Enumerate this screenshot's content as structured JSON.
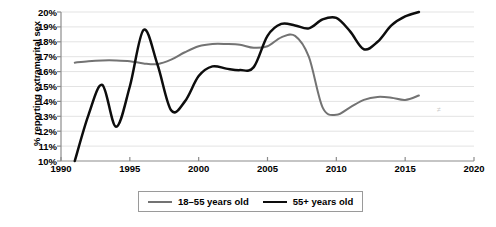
{
  "chart_data": {
    "type": "line",
    "title": "",
    "xlabel": "",
    "ylabel": "% reporting extramarital sex",
    "xlim": [
      1990,
      2020
    ],
    "ylim": [
      10,
      20
    ],
    "grid": true,
    "grid_axis": "y",
    "legend_position": "bottom-center",
    "x_ticks": [
      1990,
      1995,
      2000,
      2005,
      2010,
      2015,
      2020
    ],
    "x_tick_labels": [
      "1990",
      "1995",
      "2000",
      "2005",
      "2010",
      "2015",
      "2020"
    ],
    "y_ticks": [
      10,
      11,
      12,
      13,
      14,
      15,
      16,
      17,
      18,
      19,
      20
    ],
    "y_tick_labels": [
      "10%",
      "11%",
      "12%",
      "13%",
      "14%",
      "15%",
      "16%",
      "17%",
      "18%",
      "19%",
      "20%"
    ],
    "series": [
      {
        "name": "18–55 years old",
        "color": "#737373",
        "width": 2.0,
        "x": [
          1991,
          1992,
          1993,
          1994,
          1995,
          1996,
          1997,
          1998,
          1999,
          2000,
          2001,
          2002,
          2003,
          2004,
          2005,
          2006,
          2007,
          2008,
          2009,
          2010,
          2011,
          2012,
          2013,
          2014,
          2015,
          2016
        ],
        "values": [
          16.6,
          16.7,
          16.75,
          16.75,
          16.7,
          16.55,
          16.5,
          16.8,
          17.3,
          17.7,
          17.85,
          17.85,
          17.8,
          17.6,
          17.7,
          18.3,
          18.4,
          17.0,
          13.6,
          13.1,
          13.6,
          14.1,
          14.3,
          14.25,
          14.1,
          14.4
        ]
      },
      {
        "name": "55+ years old",
        "color": "#0d0d0d",
        "width": 2.5,
        "x": [
          1991,
          1992,
          1993,
          1994,
          1995,
          1996,
          1997,
          1998,
          1999,
          2000,
          2001,
          2002,
          2003,
          2004,
          2005,
          2006,
          2007,
          2008,
          2009,
          2010,
          2011,
          2012,
          2013,
          2014,
          2015,
          2016
        ],
        "values": [
          10.0,
          13.1,
          15.1,
          12.3,
          15.0,
          18.8,
          16.5,
          13.4,
          14.0,
          15.7,
          16.35,
          16.2,
          16.1,
          16.3,
          18.4,
          19.2,
          19.1,
          18.9,
          19.5,
          19.6,
          18.7,
          17.5,
          18.0,
          19.1,
          19.7,
          20.0
        ]
      }
    ],
    "annotations": []
  },
  "axes": {
    "y_title": "% reporting extramarital sex"
  },
  "legend": {
    "entries": [
      {
        "label": "18–55 years old",
        "swatch": "gray"
      },
      {
        "label": "55+ years old",
        "swatch": "black"
      }
    ]
  }
}
